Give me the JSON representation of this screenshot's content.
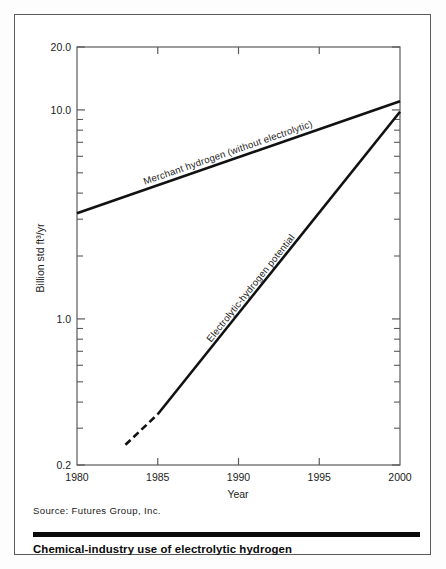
{
  "figure": {
    "caption": "Chemical-industry use of electrolytic hydrogen",
    "source": "Source:  Futures Group, Inc."
  },
  "chart_data": {
    "type": "line",
    "title": "",
    "xlabel": "Year",
    "ylabel": "Billion std ft3/yr",
    "ylabel_display": "Billion std ft³/yr",
    "yscale": "log",
    "xlim": [
      1980,
      2000
    ],
    "ylim": [
      0.2,
      20.0
    ],
    "grid": false,
    "legend": "inline-curve-labels",
    "xticks": [
      1980,
      1985,
      1990,
      1995,
      2000
    ],
    "xtick_labels": [
      "1980",
      "1985",
      "1990",
      "1995",
      "2000"
    ],
    "yticks_major": [
      0.2,
      1.0,
      10.0,
      20.0
    ],
    "ytick_labels": [
      "0.2",
      "1.0",
      "10.0",
      "20.0"
    ],
    "yticks_minor": [
      0.3,
      0.4,
      0.5,
      0.6,
      0.7,
      0.8,
      0.9,
      2,
      3,
      4,
      5,
      6,
      7,
      8,
      9
    ],
    "series": [
      {
        "name": "Merchant hydrogen (without electrolytic)",
        "label": "Merchant hydrogen (without electrolytic)",
        "style": "solid",
        "x": [
          1980,
          2000
        ],
        "y": [
          3.2,
          11.0
        ]
      },
      {
        "name": "Electrolytic-hydrogen potential",
        "label": "Electrolytic-hydrogen potential",
        "style": "dashed-then-solid",
        "dashed_segment": {
          "x": [
            1983,
            1985
          ],
          "y": [
            0.25,
            0.35
          ]
        },
        "solid_segment": {
          "x": [
            1985,
            2000
          ],
          "y": [
            0.35,
            9.8
          ]
        },
        "x": [
          1983,
          1985,
          2000
        ],
        "y": [
          0.25,
          0.35,
          9.8
        ]
      }
    ]
  },
  "colors": {
    "line": "#111111",
    "axis": "#5a5a5a",
    "text": "#1c1c1c",
    "rule": "#0a0a0a",
    "background": "#ffffff"
  }
}
